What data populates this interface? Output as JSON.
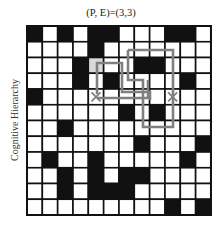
{
  "title": "(P, E)=(3,3)",
  "ylabel": "Cognitive Hierarchy",
  "grid": {
    "rows": 12,
    "cols": 12,
    "origin": [
      27,
      26
    ],
    "cell_w": 15.33,
    "cell_h": 15.75,
    "colors": {
      "black": "#111111",
      "white": "#ffffff",
      "highlight": "#d9d9d9",
      "line": "#111111",
      "path": "#808080"
    },
    "black_cells": [
      [
        1,
        1
      ],
      [
        1,
        3
      ],
      [
        1,
        5
      ],
      [
        1,
        6
      ],
      [
        1,
        10
      ],
      [
        1,
        11
      ],
      [
        2,
        5
      ],
      [
        3,
        4
      ],
      [
        3,
        8
      ],
      [
        3,
        9
      ],
      [
        4,
        4
      ],
      [
        4,
        6
      ],
      [
        4,
        11
      ],
      [
        5,
        1
      ],
      [
        6,
        7
      ],
      [
        6,
        9
      ],
      [
        7,
        3
      ],
      [
        8,
        8
      ],
      [
        8,
        12
      ],
      [
        9,
        2
      ],
      [
        9,
        5
      ],
      [
        9,
        11
      ],
      [
        10,
        3
      ],
      [
        10,
        5
      ],
      [
        10,
        7
      ],
      [
        10,
        8
      ],
      [
        11,
        3
      ],
      [
        11,
        5
      ],
      [
        11,
        6
      ],
      [
        11,
        7
      ],
      [
        12,
        10
      ],
      [
        12,
        12
      ]
    ],
    "highlight_cells": [
      [
        3,
        5
      ]
    ],
    "markers": [
      {
        "type": "x",
        "row": 5,
        "col": 5
      },
      {
        "type": "x",
        "row": 5,
        "col": 10
      }
    ],
    "paths": [
      {
        "name": "outer-loop",
        "points": [
          [
            128,
            50
          ],
          [
            173,
            50
          ],
          [
            173,
            127
          ],
          [
            143,
            127
          ],
          [
            143,
            80
          ],
          [
            128,
            80
          ],
          [
            128,
            50
          ]
        ]
      },
      {
        "name": "inner-path-a",
        "points": [
          [
            97,
            94
          ],
          [
            97,
            63
          ],
          [
            122,
            63
          ],
          [
            122,
            92
          ],
          [
            150,
            92
          ],
          [
            150,
            100
          ]
        ]
      },
      {
        "name": "inner-path-b",
        "points": [
          [
            97,
            98
          ],
          [
            148,
            98
          ],
          [
            148,
            80
          ]
        ]
      }
    ]
  }
}
